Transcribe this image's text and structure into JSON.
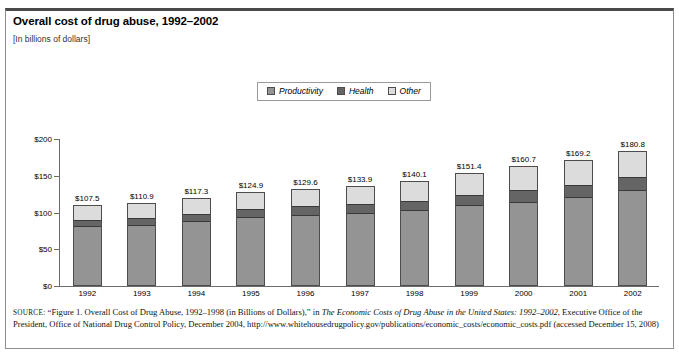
{
  "header": {
    "title": "Overall cost of drug abuse, 1992–2002",
    "subtitle": "[In billions of dollars]"
  },
  "legend": {
    "items": [
      {
        "label": "Productivity",
        "color": "#949494",
        "icon": "legend-swatch-icon"
      },
      {
        "label": "Health",
        "color": "#656565",
        "icon": "legend-swatch-icon"
      },
      {
        "label": "Other",
        "color": "#dcdcdc",
        "icon": "legend-swatch-icon"
      }
    ]
  },
  "source": {
    "kicker": "SOURCE:",
    "text_1": " “Figure 1. Overall Cost of Drug Abuse, 1992–1998 (in Billions of Dollars),” in ",
    "italic_1": "The Economic Costs of Drug Abuse in the United States: 1992–2002",
    "text_2": ", Executive Office of the President, Office of National Drug Control Policy, December 2004, http://www.whitehousedrugpolicy.gov/publications/economic_costs/economic_costs.pdf (accessed December 15, 2008)"
  },
  "chart_data": {
    "type": "bar",
    "subtype": "stacked-vertical",
    "title": "Overall cost of drug abuse, 1992–2002",
    "subtitle": "[In billions of dollars]",
    "xlabel": "",
    "ylabel": "",
    "ylim": [
      0,
      200
    ],
    "yticks": [
      0,
      50,
      100,
      150,
      200
    ],
    "ytick_labels": [
      "$0",
      "$50",
      "$100",
      "$150",
      "$200"
    ],
    "grid": false,
    "legend_position": "top-center",
    "categories": [
      "1992",
      "1993",
      "1994",
      "1995",
      "1996",
      "1997",
      "1998",
      "1999",
      "2000",
      "2001",
      "2002"
    ],
    "series": [
      {
        "name": "Productivity",
        "color": "#949494",
        "values": [
          79.7,
          82.0,
          86.5,
          92.3,
          95.1,
          97.9,
          101.6,
          108.4,
          113.4,
          120.0,
          128.6
        ]
      },
      {
        "name": "Health",
        "color": "#656565",
        "values": [
          9.4,
          9.8,
          10.6,
          11.4,
          12.1,
          12.8,
          13.3,
          14.3,
          15.2,
          16.4,
          18.4
        ]
      },
      {
        "name": "Other",
        "color": "#dcdcdc",
        "values": [
          18.4,
          19.1,
          20.2,
          21.2,
          22.4,
          23.2,
          25.2,
          28.7,
          32.1,
          32.8,
          33.8
        ]
      }
    ],
    "totals": [
      107.5,
      110.9,
      117.3,
      124.9,
      129.6,
      133.9,
      140.1,
      151.4,
      160.7,
      169.2,
      180.8
    ],
    "total_labels": [
      "$107.5",
      "$110.9",
      "$117.3",
      "$124.9",
      "$129.6",
      "$133.9",
      "$140.1",
      "$151.4",
      "$160.7",
      "$169.2",
      "$180.8"
    ]
  }
}
